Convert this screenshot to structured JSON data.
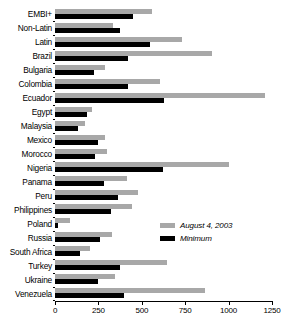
{
  "chart_data": {
    "type": "bar",
    "orientation": "horizontal",
    "title": "",
    "subtitle": "",
    "xlabel": "",
    "ylabel": "",
    "xlim": [
      0,
      1250
    ],
    "xticks": [
      0,
      250,
      500,
      750,
      1000,
      1250
    ],
    "xtick_labels": [
      "0",
      "250",
      "500",
      "750",
      "1000",
      "1250"
    ],
    "grid": false,
    "legend_position": "inside-right",
    "categories": [
      "EMBI+",
      "Non-Latin",
      "Latin",
      "Brazil",
      "Bulgaria",
      "Colombia",
      "Ecuador",
      "Egypt",
      "Malaysia",
      "Mexico",
      "Morocco",
      "Nigeria",
      "Panama",
      "Peru",
      "Philippines",
      "Poland",
      "Russia",
      "South Africa",
      "Turkey",
      "Ukraine",
      "Venezuela"
    ],
    "series": [
      {
        "name": "August 4, 2003",
        "color": "#a8a8a8",
        "values": [
          560,
          335,
          730,
          905,
          290,
          605,
          1210,
          215,
          175,
          290,
          300,
          1000,
          415,
          480,
          445,
          85,
          330,
          200,
          645,
          345,
          865
        ]
      },
      {
        "name": "Minimum",
        "color": "#000000",
        "values": [
          450,
          375,
          550,
          420,
          225,
          420,
          630,
          185,
          135,
          245,
          230,
          620,
          280,
          365,
          325,
          20,
          260,
          145,
          375,
          245,
          395
        ]
      }
    ]
  },
  "legend": {
    "items": [
      {
        "label": "August 4, 2003",
        "swatch": "current"
      },
      {
        "label": "Minimum",
        "swatch": "min"
      }
    ]
  }
}
